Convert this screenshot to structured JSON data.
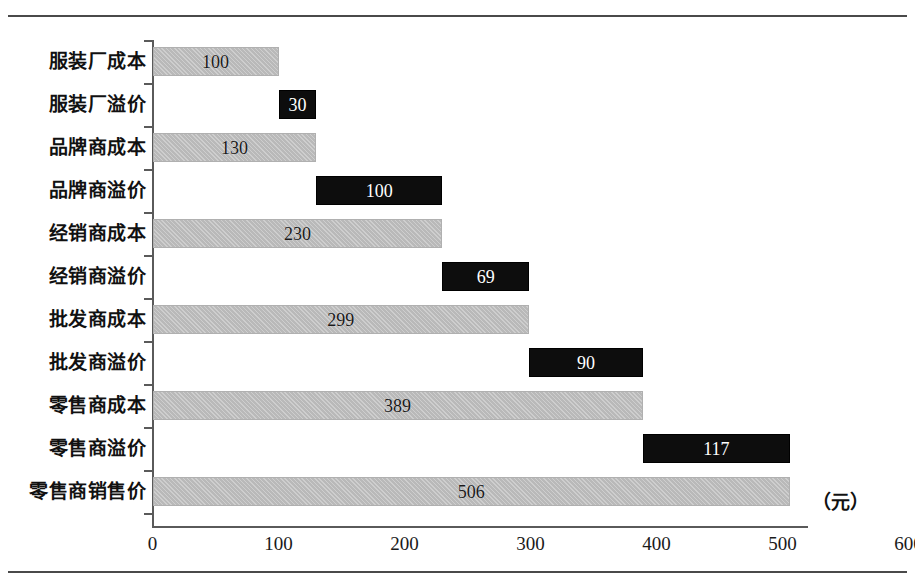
{
  "chart_data": {
    "type": "bar",
    "orientation": "horizontal",
    "title": "",
    "subtitle": "",
    "xlabel": "",
    "ylabel": "",
    "unit_annotation": "（元）",
    "xlim": [
      0,
      600
    ],
    "xticks": [
      0,
      100,
      200,
      300,
      400,
      500,
      600
    ],
    "xtick_labels": [
      "0",
      "100",
      "200",
      "300",
      "400",
      "500",
      "600"
    ],
    "grid": false,
    "legend": false,
    "categories": [
      "服装厂成本",
      "服装厂溢价",
      "品牌商成本",
      "品牌商溢价",
      "经销商成本",
      "经销商溢价",
      "批发商成本",
      "批发商溢价",
      "零售商成本",
      "零售商溢价",
      "零售商销售价"
    ],
    "bars": [
      {
        "category": "服装厂成本",
        "start": 0,
        "end": 100,
        "value": 100,
        "label": "100",
        "kind": "cost"
      },
      {
        "category": "服装厂溢价",
        "start": 100,
        "end": 130,
        "value": 30,
        "label": "30",
        "kind": "premium"
      },
      {
        "category": "品牌商成本",
        "start": 0,
        "end": 130,
        "value": 130,
        "label": "130",
        "kind": "cost"
      },
      {
        "category": "品牌商溢价",
        "start": 130,
        "end": 230,
        "value": 100,
        "label": "100",
        "kind": "premium"
      },
      {
        "category": "经销商成本",
        "start": 0,
        "end": 230,
        "value": 230,
        "label": "230",
        "kind": "cost"
      },
      {
        "category": "经销商溢价",
        "start": 230,
        "end": 299,
        "value": 69,
        "label": "69",
        "kind": "premium"
      },
      {
        "category": "批发商成本",
        "start": 0,
        "end": 299,
        "value": 299,
        "label": "299",
        "kind": "cost"
      },
      {
        "category": "批发商溢价",
        "start": 299,
        "end": 389,
        "value": 90,
        "label": "90",
        "kind": "premium"
      },
      {
        "category": "零售商成本",
        "start": 0,
        "end": 389,
        "value": 389,
        "label": "389",
        "kind": "cost"
      },
      {
        "category": "零售商溢价",
        "start": 389,
        "end": 506,
        "value": 117,
        "label": "117",
        "kind": "premium"
      },
      {
        "category": "零售商销售价",
        "start": 0,
        "end": 506,
        "value": 506,
        "label": "506",
        "kind": "cost"
      }
    ],
    "colors": {
      "cost_bar": "#b9b9b9",
      "premium_bar": "#0d0d0d",
      "axis": "#5a5a5a",
      "frame": "#4a4a4a",
      "cost_value_text": "#1a1a1a",
      "premium_value_text": "#ffffff",
      "background": "#ffffff"
    }
  }
}
